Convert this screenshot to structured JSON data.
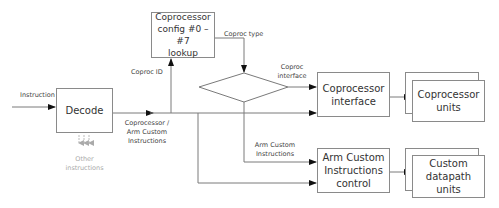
{
  "diagram": {
    "nodes": {
      "decode": {
        "label": "Decode"
      },
      "config_lookup": {
        "label": "Coprocessor\nconfig #0 –#7\nlookup"
      },
      "coproc_interface": {
        "label": "Coprocessor\ninterface"
      },
      "coproc_units": {
        "label": "Coprocessor\nunits"
      },
      "arm_custom_control": {
        "label": "Arm Custom\nInstructions\ncontrol"
      },
      "custom_datapath_units": {
        "label": "Custom\ndatapath units"
      },
      "decision": {
        "label": ""
      }
    },
    "edge_labels": {
      "instruction": "Instruction",
      "coproc_id": "Coproc ID",
      "coproc_type": "Coproc type",
      "coproc_interface": "Coproc\ninterface",
      "coproc_arm_custom": "Coprocessor /\nArm Custom\nInstructions",
      "arm_custom_instructions": "Arm Custom\nInstructions",
      "other_instructions": "Other\ninstructions"
    },
    "colors": {
      "line": "#7a7a7a",
      "box_border": "#8a8a8a",
      "arrow": "#111111",
      "faded": "#aaaaaa"
    }
  }
}
